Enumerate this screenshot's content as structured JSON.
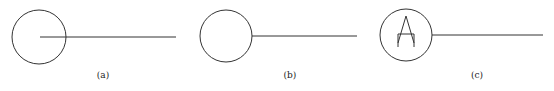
{
  "figures": [
    {
      "label": "(a)",
      "variant": "line-enters-circle",
      "symbol": ""
    },
    {
      "label": "(b)",
      "variant": "line-touches-circle",
      "symbol": ""
    },
    {
      "label": "(c)",
      "variant": "circle-with-letter",
      "symbol": "A"
    }
  ],
  "colors": {
    "stroke": "#333333",
    "background": "#ffffff"
  }
}
